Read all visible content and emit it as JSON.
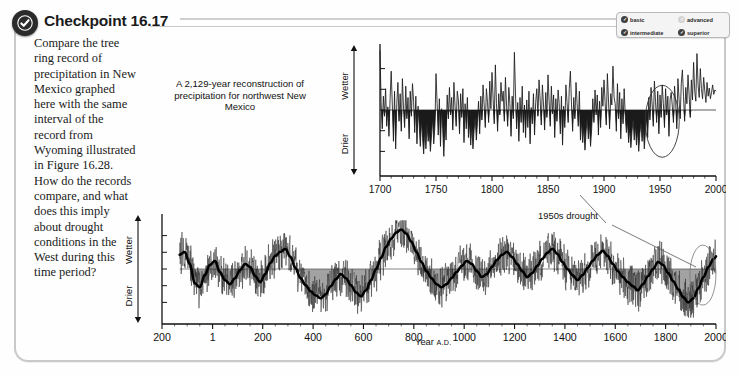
{
  "header": {
    "title": "Checkpoint 16.17",
    "badge_icon": "check-circle-icon"
  },
  "question": {
    "text": "Compare the tree ring record of precipitation in New Mexico graphed here with the same interval of the record from Wyoming illustrated in Figure 16.28. How do the records compare, and what does this imply about drought conditions in the West during this time period?"
  },
  "level_legend": {
    "items": [
      {
        "label": "basic",
        "state": "on"
      },
      {
        "label": "advanced",
        "state": "off"
      },
      {
        "label": "intermediate",
        "state": "on"
      },
      {
        "label": "superior",
        "state": "on"
      }
    ]
  },
  "figure": {
    "caption": "A 2,129-year reconstruction of precipitation for northwest New Mexico",
    "annotation": "1950s drought",
    "axis_wetter": "Wetter",
    "axis_drier": "Drier",
    "xlabel_main": "Year",
    "xlabel_suffix": "A.D."
  },
  "chart_data": [
    {
      "type": "line",
      "id": "top-detail-1700-2000",
      "title": "Reconstructed precipitation, northwest New Mexico (detail 1700-2000)",
      "xlabel": "Year A.D.",
      "ylabel": "Wetter / Drier (departure from mean)",
      "xlim": [
        1700,
        2000
      ],
      "ylim": [
        -1.0,
        1.0
      ],
      "grid": false,
      "zero_line": true,
      "legend_position": "none",
      "xticks": [
        1700,
        1750,
        1800,
        1850,
        1900,
        1950,
        2000
      ],
      "annotations": [
        {
          "text": "1950s drought",
          "x": 1955,
          "y": -0.2,
          "marker": "ellipse"
        }
      ],
      "series": [
        {
          "name": "Annual precipitation index",
          "x_start": 1700,
          "x_step": 1,
          "values": [
            0.95,
            0.12,
            -0.3,
            0.22,
            -0.1,
            0.34,
            -0.26,
            0.05,
            -0.42,
            0.18,
            0.62,
            0.08,
            -0.5,
            0.3,
            -0.62,
            0.1,
            0.44,
            -0.18,
            0.26,
            -0.34,
            0.5,
            0.02,
            -0.28,
            0.38,
            -0.14,
            0.2,
            -0.46,
            0.3,
            -0.1,
            0.42,
            0.14,
            -0.36,
            0.22,
            -0.54,
            0.06,
            -0.24,
            -0.58,
            -0.16,
            -0.44,
            -0.7,
            -0.3,
            -0.62,
            -0.22,
            -0.5,
            -0.34,
            -0.66,
            -0.4,
            -0.12,
            -0.54,
            -0.26,
            0.58,
            0.1,
            -0.4,
            0.18,
            -0.58,
            0.02,
            -0.3,
            -0.74,
            -0.2,
            -0.48,
            0.24,
            -0.14,
            0.36,
            -0.08,
            0.2,
            -0.32,
            0.44,
            0.06,
            -0.26,
            0.3,
            0.16,
            -0.38,
            0.26,
            -0.12,
            0.34,
            -0.52,
            0.1,
            -0.3,
            0.2,
            -0.44,
            -0.18,
            -0.56,
            -0.24,
            -0.62,
            -0.32,
            -0.1,
            -0.48,
            -0.2,
            0.14,
            -0.38,
            0.22,
            -0.16,
            0.4,
            0.08,
            -0.28,
            0.34,
            0.12,
            -0.2,
            0.46,
            0.02,
            0.6,
            0.18,
            -0.22,
            0.72,
            0.1,
            -0.34,
            0.26,
            -0.08,
            0.44,
            0.14,
            0.3,
            -0.18,
            0.52,
            0.06,
            -0.26,
            0.36,
            0.1,
            -0.42,
            0.22,
            -0.14,
            0.92,
            0.24,
            -0.3,
            0.12,
            -0.5,
            0.2,
            -0.2,
            0.38,
            -0.36,
            0.08,
            -0.44,
            0.16,
            -0.28,
            0.3,
            -0.54,
            0.04,
            -0.22,
            0.26,
            -0.4,
            0.12,
            0.34,
            -0.1,
            0.48,
            0.16,
            -0.24,
            0.4,
            0.08,
            -0.32,
            0.28,
            -0.12,
            0.56,
            0.14,
            -0.26,
            0.38,
            -0.06,
            0.24,
            -0.44,
            0.18,
            -0.18,
            0.32,
            0.1,
            -0.38,
            0.22,
            -0.56,
            0.06,
            -0.28,
            0.4,
            0.12,
            -0.2,
            0.34,
            0.62,
            0.08,
            -0.34,
            0.2,
            -0.14,
            0.44,
            0.1,
            -0.26,
            0.3,
            -0.48,
            -0.16,
            -0.52,
            -0.26,
            -0.64,
            -0.34,
            -0.12,
            -0.46,
            -0.22,
            -0.58,
            -0.3,
            0.18,
            -0.2,
            0.32,
            -0.08,
            0.24,
            -0.4,
            0.14,
            -0.28,
            0.36,
            0.06,
            0.48,
            0.12,
            -0.24,
            0.58,
            0.16,
            -0.3,
            0.26,
            0.08,
            0.7,
            0.2,
            0.1,
            -0.34,
            0.42,
            -0.14,
            0.28,
            -0.46,
            0.18,
            -0.22,
            0.34,
            -0.1,
            -0.36,
            -0.18,
            -0.52,
            -0.28,
            -0.6,
            -0.34,
            -0.14,
            -0.48,
            -0.24,
            -0.56,
            -0.3,
            -0.66,
            -0.38,
            -0.2,
            -0.5,
            -0.26,
            -0.62,
            -0.32,
            -0.12,
            -0.44,
            0.2,
            -0.16,
            0.36,
            0.08,
            -0.26,
            0.46,
            0.14,
            -0.2,
            0.3,
            -0.38,
            0.24,
            -0.12,
            0.4,
            0.1,
            -0.28,
            0.34,
            -0.08,
            0.22,
            -0.42,
            0.16,
            0.28,
            0.06,
            -0.2,
            0.38,
            0.12,
            -0.3,
            0.5,
            0.18,
            -0.14,
            0.42,
            0.64,
            0.22,
            -0.18,
            0.36,
            0.1,
            0.56,
            0.24,
            -0.12,
            0.48,
            0.16,
            0.76,
            0.3,
            0.14,
            0.9,
            0.4,
            0.2,
            0.66,
            0.34,
            0.18,
            0.52,
            0.3,
            0.12,
            0.44,
            0.22,
            0.35,
            0.18,
            0.28,
            0.4,
            0.25,
            0.32,
            0.3
          ]
        }
      ]
    },
    {
      "type": "line",
      "id": "bottom-full-200bc-2000ad",
      "title": "Reconstructed precipitation, northwest New Mexico (full 2,129-year record)",
      "xlabel": "Year A.D.",
      "ylabel": "Wetter / Drier (departure from mean)",
      "xlim": [
        -200,
        2000
      ],
      "ylim": [
        -1.0,
        1.0
      ],
      "grid": false,
      "zero_line": true,
      "legend_position": "none",
      "xtick_labels": [
        "200",
        "1",
        "200",
        "400",
        "600",
        "800",
        "1000",
        "1200",
        "1400",
        "1600",
        "1800",
        "2000"
      ],
      "xtick_values": [
        -200,
        1,
        200,
        400,
        600,
        800,
        1000,
        1200,
        1400,
        1600,
        1800,
        2000
      ],
      "annotations": [
        {
          "text": "1950s drought",
          "x": 1950,
          "y": -0.25,
          "marker": "ellipse"
        }
      ],
      "series": [
        {
          "name": "Annual precipitation index",
          "note": "high-frequency annual values (thin grey trace)"
        },
        {
          "name": "Smoothed (decadal) trend",
          "note": "heavy black smoothed curve",
          "x_start": -130,
          "x_step": 20,
          "values": [
            0.28,
            0.34,
            0.1,
            -0.28,
            -0.36,
            -0.12,
            0.08,
            0.16,
            -0.06,
            -0.22,
            -0.3,
            -0.18,
            -0.02,
            0.1,
            0.04,
            -0.14,
            -0.26,
            -0.1,
            0.12,
            0.26,
            0.34,
            0.4,
            0.24,
            0.02,
            -0.18,
            -0.32,
            -0.44,
            -0.52,
            -0.58,
            -0.5,
            -0.34,
            -0.2,
            -0.1,
            -0.18,
            -0.32,
            -0.46,
            -0.54,
            -0.42,
            -0.22,
            0.0,
            0.22,
            0.44,
            0.6,
            0.72,
            0.78,
            0.7,
            0.54,
            0.34,
            0.14,
            -0.04,
            -0.18,
            -0.3,
            -0.36,
            -0.3,
            -0.18,
            -0.06,
            0.06,
            0.16,
            0.1,
            -0.04,
            -0.16,
            -0.1,
            0.04,
            0.18,
            0.28,
            0.34,
            0.24,
            0.1,
            -0.04,
            -0.16,
            -0.08,
            0.06,
            0.2,
            0.32,
            0.4,
            0.3,
            0.14,
            0.0,
            -0.12,
            -0.22,
            -0.12,
            0.02,
            0.16,
            0.28,
            0.36,
            0.26,
            0.1,
            -0.04,
            -0.16,
            -0.26,
            -0.34,
            -0.42,
            -0.3,
            -0.14,
            0.0,
            0.14,
            0.08,
            -0.08,
            -0.24,
            -0.4,
            -0.56,
            -0.66,
            -0.58,
            -0.38,
            -0.16,
            0.04,
            0.2,
            0.3,
            0.22,
            0.08,
            -0.06,
            -0.18,
            -0.3,
            -0.2,
            -0.04,
            0.12,
            0.26,
            0.38,
            0.46,
            0.4,
            0.26,
            0.1,
            -0.06,
            -0.2,
            -0.34,
            -0.42,
            -0.24,
            0.1,
            0.44,
            0.52
          ]
        }
      ]
    }
  ]
}
